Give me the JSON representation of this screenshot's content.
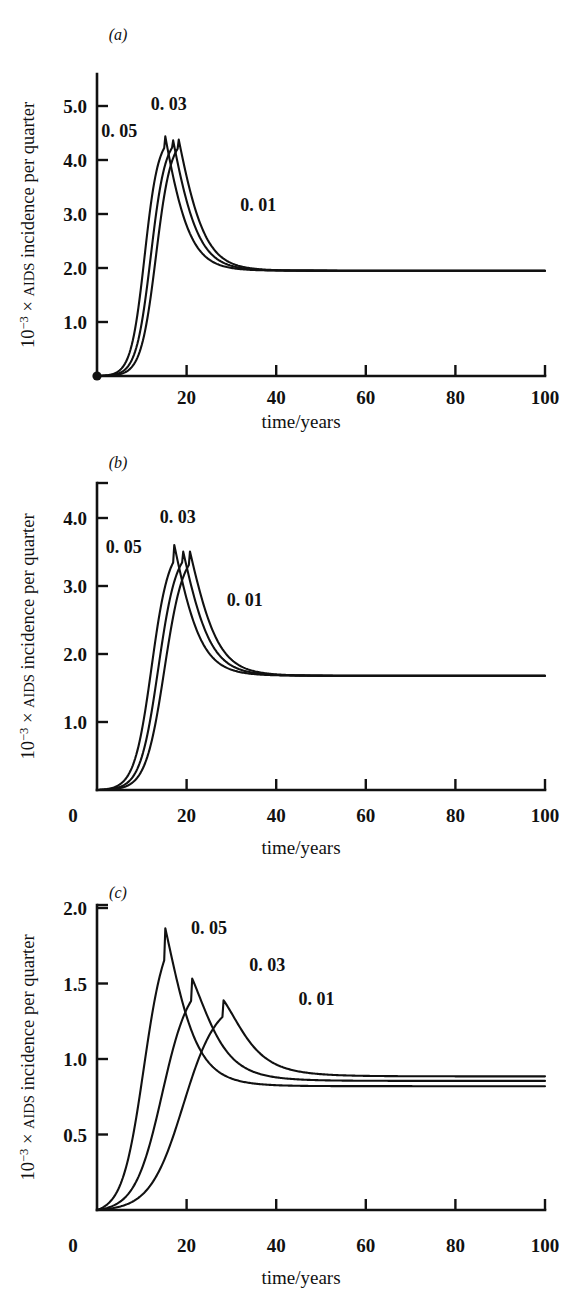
{
  "figure": {
    "background": "#ffffff",
    "ink_color": "#111111",
    "panel_count": 3
  },
  "axis_titles": {
    "x": "time/years",
    "y_prefix": "10",
    "y_exponent": "−3",
    "y_times": " × ",
    "y_smallcaps": "AIDS",
    "y_rest": " incidence per quarter",
    "y_full": "10−3 × AIDS incidence per quarter"
  },
  "panels": [
    {
      "id": "a",
      "letter": "(a)",
      "ytick_labels": [
        "1.0",
        "2.0",
        "3.0",
        "4.0",
        "5.0"
      ],
      "xtick_labels": [
        "20",
        "40",
        "60",
        "80",
        "100"
      ],
      "x_zero_label": "",
      "curve_labels": [
        {
          "text": "0. 05",
          "x": 9,
          "y": 4.42,
          "anchor": "end"
        },
        {
          "text": "0. 03",
          "x": 16,
          "y": 4.92,
          "anchor": "middle"
        },
        {
          "text": "0. 01",
          "x": 36,
          "y": 3.05,
          "anchor": "middle"
        }
      ]
    },
    {
      "id": "b",
      "letter": "(b)",
      "ytick_labels": [
        "1.0",
        "2.0",
        "3.0",
        "4.0"
      ],
      "xtick_labels": [
        "20",
        "40",
        "60",
        "80",
        "100"
      ],
      "x_zero_label": "0",
      "curve_labels": [
        {
          "text": "0. 05",
          "x": 10,
          "y": 3.48,
          "anchor": "end"
        },
        {
          "text": "0. 03",
          "x": 18,
          "y": 3.92,
          "anchor": "middle"
        },
        {
          "text": "0. 01",
          "x": 33,
          "y": 2.7,
          "anchor": "middle"
        }
      ]
    },
    {
      "id": "c",
      "letter": "(c)",
      "ytick_labels": [
        "0.5",
        "1.0",
        "1.5",
        "2.0"
      ],
      "xtick_labels": [
        "20",
        "40",
        "60",
        "80",
        "100"
      ],
      "x_zero_label": "0",
      "curve_labels": [
        {
          "text": "0. 05",
          "x": 25,
          "y": 1.83,
          "anchor": "middle"
        },
        {
          "text": "0. 03",
          "x": 38,
          "y": 1.58,
          "anchor": "middle"
        },
        {
          "text": "0. 01",
          "x": 49,
          "y": 1.36,
          "anchor": "middle"
        }
      ]
    }
  ],
  "chart_data": {
    "type": "line",
    "title": "",
    "xlabel": "time/years",
    "ylabel": "10−3 × AIDS incidence per quarter",
    "grid": false,
    "legend": "inline curve labels",
    "panels": [
      {
        "panel": "a",
        "xlim": [
          0,
          100
        ],
        "ylim": [
          0,
          5.2
        ],
        "xticks": [
          20,
          40,
          60,
          80,
          100
        ],
        "yticks": [
          1.0,
          2.0,
          3.0,
          4.0,
          5.0
        ],
        "origin_marker": true,
        "series": [
          {
            "name": "0. 05",
            "onset": 3.2,
            "growth": 0.66,
            "peak_time": 15.2,
            "peak_value": 4.46,
            "decay": 0.185,
            "plateau": 1.95
          },
          {
            "name": "0. 03",
            "onset": 4.2,
            "growth": 0.62,
            "peak_time": 16.8,
            "peak_value": 4.45,
            "decay": 0.175,
            "plateau": 1.95
          },
          {
            "name": "0. 01",
            "onset": 5.1,
            "growth": 0.6,
            "peak_time": 18.1,
            "peak_value": 4.44,
            "decay": 0.168,
            "plateau": 1.95
          }
        ]
      },
      {
        "panel": "b",
        "xlim": [
          0,
          100
        ],
        "ylim": [
          0,
          4.5
        ],
        "xticks": [
          20,
          40,
          60,
          80,
          100
        ],
        "yticks": [
          1.0,
          2.0,
          3.0,
          4.0
        ],
        "origin_marker": false,
        "series": [
          {
            "name": "0. 05",
            "onset": 4.0,
            "growth": 0.52,
            "peak_time": 17.2,
            "peak_value": 3.62,
            "decay": 0.165,
            "plateau": 1.68
          },
          {
            "name": "0. 03",
            "onset": 5.0,
            "growth": 0.5,
            "peak_time": 19.0,
            "peak_value": 3.58,
            "decay": 0.158,
            "plateau": 1.68
          },
          {
            "name": "0. 01",
            "onset": 6.0,
            "growth": 0.48,
            "peak_time": 20.6,
            "peak_value": 3.55,
            "decay": 0.152,
            "plateau": 1.68
          }
        ]
      },
      {
        "panel": "c",
        "xlim": [
          0,
          100
        ],
        "ylim": [
          0,
          2.1
        ],
        "xticks": [
          20,
          40,
          60,
          80,
          100
        ],
        "yticks": [
          0.5,
          1.0,
          1.5,
          2.0
        ],
        "origin_marker": false,
        "series": [
          {
            "name": "0. 05",
            "onset": 3.0,
            "growth": 0.42,
            "peak_time": 15.0,
            "peak_value": 1.9,
            "decay": 0.125,
            "plateau": 0.82
          },
          {
            "name": "0. 03",
            "onset": 4.0,
            "growth": 0.33,
            "peak_time": 21.0,
            "peak_value": 1.55,
            "decay": 0.098,
            "plateau": 0.855
          },
          {
            "name": "0. 01",
            "onset": 5.0,
            "growth": 0.27,
            "peak_time": 28.0,
            "peak_value": 1.4,
            "decay": 0.082,
            "plateau": 0.885
          }
        ]
      }
    ]
  }
}
